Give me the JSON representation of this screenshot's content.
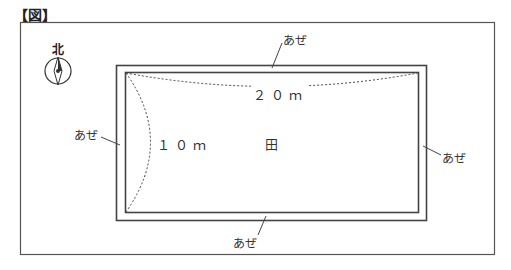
{
  "figure": {
    "title": "【図】",
    "compass_label": "北",
    "field_label": "田",
    "dimensions": {
      "width": "２０ｍ",
      "height": "１０ｍ"
    },
    "levee_labels": {
      "top": "あぜ",
      "left": "あぜ",
      "right": "あぜ",
      "bottom": "あぜ"
    }
  }
}
